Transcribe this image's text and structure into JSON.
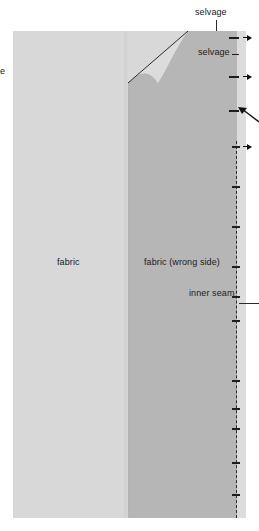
{
  "figure": {
    "type": "sewing-pattern-diagram",
    "background_color": "#ffffff",
    "colors": {
      "fabric_right_side": "#d8d8d8",
      "fabric_wrong_side": "#b6b6b6",
      "selvage_strip": "#dcdcdc",
      "line": "#1d1d1d",
      "text": "#1a1a1a"
    }
  },
  "labels": {
    "selvage_top": "selvage",
    "selvage_right": "selvage",
    "selvage_left_clipped": "ge",
    "fabric": "fabric",
    "fabric_wrong_side": "fabric (wrong side)",
    "inner_seam": "inner seam"
  },
  "regions": [
    {
      "name": "fabric-right-side",
      "label": "fabric"
    },
    {
      "name": "fabric-wrong-side",
      "label": "fabric (wrong side)"
    },
    {
      "name": "selvage-strip",
      "label": "selvage"
    }
  ],
  "markers": {
    "edge_ticks_count": 14,
    "arrow_markers_count": 4,
    "inner_seam_line_style": "dashed"
  }
}
